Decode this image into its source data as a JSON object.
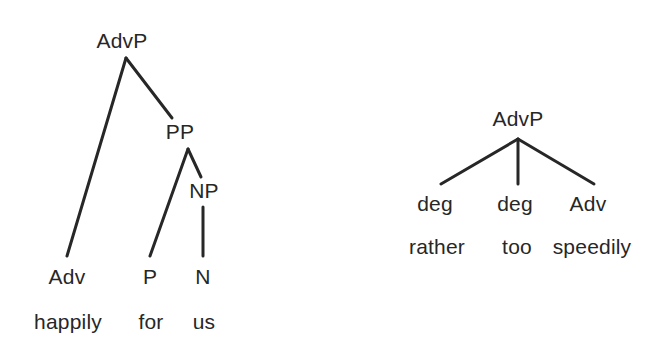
{
  "figure": {
    "type": "syntax-tree-diagram",
    "background_color": "#ffffff",
    "ink_color": "#272727",
    "tree_count": 2
  },
  "trees": [
    {
      "id": "tree-adverb-phrase-happily-for-us",
      "root": "AdvP",
      "sentence": "happily for us",
      "nodes": [
        {
          "name": "root",
          "label": "AdvP",
          "x": 122,
          "y": 40
        },
        {
          "name": "pp",
          "label": "PP",
          "x": 180,
          "y": 131
        },
        {
          "name": "np",
          "label": "NP",
          "x": 204,
          "y": 190
        },
        {
          "name": "adv",
          "label": "Adv",
          "x": 67,
          "y": 276
        },
        {
          "name": "p",
          "label": "P",
          "x": 150,
          "y": 276
        },
        {
          "name": "n",
          "label": "N",
          "x": 203,
          "y": 276
        }
      ],
      "words": [
        {
          "name": "word-happily",
          "label": "happily",
          "x": 68,
          "y": 321
        },
        {
          "name": "word-for",
          "label": "for",
          "x": 151,
          "y": 321
        },
        {
          "name": "word-us",
          "label": "us",
          "x": 204,
          "y": 321
        }
      ],
      "edges": [
        {
          "name": "edge-root-to-adv",
          "from": "root",
          "to": "adv",
          "x1": 126,
          "y1": 58,
          "x2": 67,
          "y2": 256
        },
        {
          "name": "edge-root-to-pp",
          "from": "root",
          "to": "pp",
          "x1": 126,
          "y1": 58,
          "x2": 172,
          "y2": 118
        },
        {
          "name": "edge-pp-to-p",
          "from": "pp",
          "to": "p",
          "x1": 188,
          "y1": 149,
          "x2": 150,
          "y2": 256
        },
        {
          "name": "edge-pp-to-np",
          "from": "pp",
          "to": "np",
          "x1": 188,
          "y1": 149,
          "x2": 201,
          "y2": 177
        },
        {
          "name": "edge-np-to-n",
          "from": "np",
          "to": "n",
          "x1": 203,
          "y1": 207,
          "x2": 203,
          "y2": 256
        }
      ]
    },
    {
      "id": "tree-adverb-phrase-rather-too-speedily",
      "root": "AdvP",
      "sentence": "rather too speedily",
      "nodes": [
        {
          "name": "root",
          "label": "AdvP",
          "x": 518,
          "y": 118
        },
        {
          "name": "deg-1",
          "label": "deg",
          "x": 435,
          "y": 203
        },
        {
          "name": "deg-2",
          "label": "deg",
          "x": 515,
          "y": 203
        },
        {
          "name": "adv",
          "label": "Adv",
          "x": 588,
          "y": 203
        }
      ],
      "words": [
        {
          "name": "word-rather",
          "label": "rather",
          "x": 437,
          "y": 246
        },
        {
          "name": "word-too",
          "label": "too",
          "x": 517,
          "y": 246
        },
        {
          "name": "word-speedily",
          "label": "speedily",
          "x": 592,
          "y": 246
        }
      ],
      "edges": [
        {
          "name": "edge-root-to-deg-1",
          "from": "root",
          "to": "deg-1",
          "x1": 518,
          "y1": 139,
          "x2": 441,
          "y2": 184
        },
        {
          "name": "edge-root-to-deg-2",
          "from": "root",
          "to": "deg-2",
          "x1": 518,
          "y1": 139,
          "x2": 518,
          "y2": 184
        },
        {
          "name": "edge-root-to-adv",
          "from": "root",
          "to": "adv",
          "x1": 518,
          "y1": 139,
          "x2": 594,
          "y2": 184
        }
      ]
    }
  ]
}
